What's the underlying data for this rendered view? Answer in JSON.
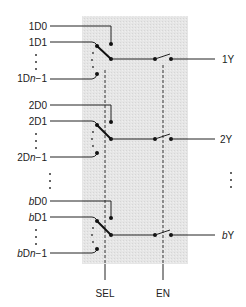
{
  "diagram": {
    "title": "",
    "colors": {
      "shade": "#e3e3e3",
      "wire": "#222222",
      "background": "#ffffff"
    },
    "groups": [
      {
        "inputs": [
          {
            "label": "1D0"
          },
          {
            "label": "1D1"
          },
          {
            "label": "1Dn−1",
            "prefix": "1D",
            "italic": "n",
            "suffix": "−1"
          }
        ],
        "output": {
          "label": "1Y"
        }
      },
      {
        "inputs": [
          {
            "label": "2D0"
          },
          {
            "label": "2D1"
          },
          {
            "label": "2Dn−1",
            "prefix": "2D",
            "italic": "n",
            "suffix": "−1"
          }
        ],
        "output": {
          "label": "2Y"
        }
      },
      {
        "inputs": [
          {
            "label": "bD0",
            "italic": "b",
            "suffix": "D0"
          },
          {
            "label": "bD1",
            "italic": "b",
            "suffix": "D1"
          },
          {
            "label": "bDn−1",
            "italic": "b",
            "mid": "D",
            "italic2": "n",
            "suffix": "−1"
          }
        ],
        "output": {
          "label": "bY",
          "italic": "b",
          "suffix": "Y"
        }
      }
    ],
    "controls": {
      "select": {
        "label": "SEL"
      },
      "enable": {
        "label": "EN"
      }
    },
    "ellipsis": {
      "vertical_left": "⋮",
      "vertical_right": "⋮"
    }
  }
}
